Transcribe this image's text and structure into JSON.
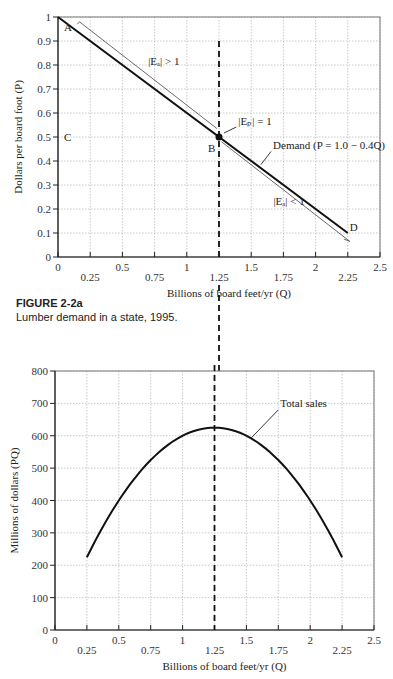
{
  "caption": {
    "title": "FIGURE 2-2a",
    "text": "Lumber demand in a state, 1995."
  },
  "chart_data": [
    {
      "type": "line",
      "id": "demand",
      "title": "",
      "xlabel": "Billions of board feet/yr (Q)",
      "ylabel": "Dollars per board foot (P)",
      "xlim": [
        0,
        2.5
      ],
      "ylim": [
        0,
        1
      ],
      "x_ticks_upper": [
        "0",
        "0.5",
        "1",
        "1.5",
        "2",
        "2.5"
      ],
      "x_ticks_lower": [
        "0.25",
        "0.75",
        "1.25",
        "1.75",
        "2.25"
      ],
      "y_ticks": [
        "0",
        "0.1",
        "0.2",
        "0.3",
        "0.4",
        "0.5",
        "0.6",
        "0.7",
        "0.8",
        "0.9",
        "1"
      ],
      "grid": true,
      "series": [
        {
          "name": "Demand (P = 1.0 − 0.4Q)",
          "x": [
            0,
            2.25
          ],
          "y": [
            1.0,
            0.1
          ]
        }
      ],
      "points": [
        {
          "label": "A",
          "x": 0,
          "y": 1.0
        },
        {
          "label": "B",
          "x": 1.25,
          "y": 0.5
        },
        {
          "label": "C",
          "x": 0,
          "y": 0.5
        },
        {
          "label": "D",
          "x": 2.25,
          "y": 0.1
        }
      ],
      "annotations": {
        "elastic": "|Eₐ| > 1",
        "unit": "|Eₚ| = 1",
        "inelastic": "|Eₐ| < 1",
        "demand": "Demand (P = 1.0 − 0.4Q)"
      },
      "vline_x": 1.25
    },
    {
      "type": "line",
      "id": "sales",
      "title": "",
      "xlabel": "Billions of board feet/yr (Q)",
      "ylabel": "Millions of dollars (PQ)",
      "xlim": [
        0,
        2.5
      ],
      "ylim": [
        0,
        800
      ],
      "x_ticks_upper": [
        "0",
        "0.5",
        "1",
        "1.5",
        "2",
        "2.5"
      ],
      "x_ticks_lower": [
        "0.25",
        "0.75",
        "1.25",
        "1.75",
        "2.25"
      ],
      "y_ticks": [
        "0",
        "100",
        "200",
        "300",
        "400",
        "500",
        "600",
        "700",
        "800"
      ],
      "grid": true,
      "series": [
        {
          "name": "Total sales",
          "x": [
            0.25,
            0.5,
            0.75,
            1.0,
            1.25,
            1.5,
            1.75,
            2.0,
            2.25
          ],
          "y": [
            225,
            400,
            525,
            600,
            625,
            600,
            525,
            400,
            225
          ]
        }
      ],
      "annotations": {
        "sales": "Total sales"
      },
      "vline_x": 1.25
    }
  ]
}
